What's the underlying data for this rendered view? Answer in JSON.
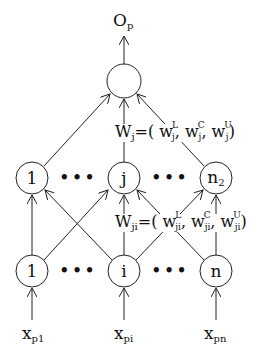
{
  "output": {
    "label": "O",
    "sub": "p"
  },
  "output_weights": {
    "lhs": "W",
    "lhs_sub": "j",
    "eq": "=(",
    "terms": [
      {
        "w": "w",
        "sup": "L",
        "sub": "j"
      },
      {
        "w": "w",
        "sup": "C",
        "sub": "j"
      },
      {
        "w": "w",
        "sup": "U",
        "sub": "j"
      }
    ],
    "close": ")"
  },
  "hidden_weights": {
    "lhs": "W",
    "lhs_sub": "ji",
    "eq": "=(",
    "terms": [
      {
        "w": "w",
        "sup": "L",
        "sub": "ji"
      },
      {
        "w": "w",
        "sup": "C",
        "sub": "ji"
      },
      {
        "w": "w",
        "sup": "U",
        "sub": "ji"
      }
    ],
    "close": ")"
  },
  "hidden_nodes": [
    {
      "label": "1"
    },
    {
      "label": "j"
    },
    {
      "label": "n",
      "sub": "2"
    }
  ],
  "input_nodes": [
    {
      "label": "1"
    },
    {
      "label": "i"
    },
    {
      "label": "n"
    }
  ],
  "inputs": [
    {
      "label": "x",
      "sub": "p1"
    },
    {
      "label": "x",
      "sub": "pi"
    },
    {
      "label": "x",
      "sub": "pn"
    }
  ],
  "ellipsis": "•••",
  "comma": ","
}
